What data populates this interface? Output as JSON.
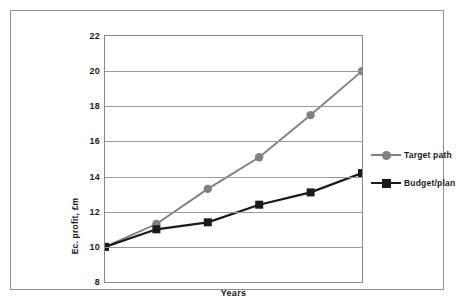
{
  "chart_data": {
    "type": "line",
    "title": "",
    "xlabel": "Years",
    "ylabel": "Ec. profit, £m",
    "ylim": [
      8,
      22
    ],
    "yticks": [
      22,
      20,
      18,
      16,
      14,
      12,
      10,
      8
    ],
    "grid": true,
    "legend_position": "right",
    "x": [
      0,
      1,
      2,
      3,
      4,
      5
    ],
    "xtick_labels": [],
    "series": [
      {
        "name": "Target path",
        "color": "#808080",
        "marker": "circle",
        "values": [
          10.0,
          11.3,
          13.3,
          15.1,
          17.5,
          20.0
        ]
      },
      {
        "name": "Budget/plan",
        "color": "#1a1a1a",
        "marker": "square",
        "values": [
          10.0,
          11.0,
          11.4,
          12.4,
          13.1,
          14.2
        ]
      }
    ]
  },
  "axes": {
    "y_tick_labels": [
      "22",
      "20",
      "18",
      "16",
      "14",
      "12",
      "10",
      "8"
    ],
    "y_axis_title": "Ec. profit, £m",
    "x_axis_title": "Years"
  },
  "legend": {
    "items": [
      {
        "label": "Target path",
        "color": "#808080",
        "marker": "circle"
      },
      {
        "label": "Budget/plan",
        "color": "#1a1a1a",
        "marker": "square"
      }
    ]
  },
  "colors": {
    "target_path": "#808080",
    "budget_plan": "#1a1a1a",
    "gridline": "#9a9a9a",
    "plot_border": "#8a8a8a",
    "frame_border": "#8f8f8f",
    "background": "#ffffff"
  }
}
